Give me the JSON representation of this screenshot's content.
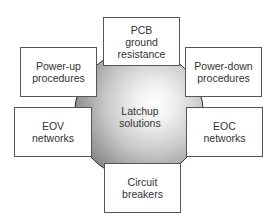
{
  "diagram": {
    "type": "hub-and-spoke",
    "center": {
      "label": "Latchup\nsolutions"
    },
    "nodes": [
      {
        "id": "top",
        "label": "PCB\nground\nresistance"
      },
      {
        "id": "upper-left",
        "label": "Power-up\nprocedures"
      },
      {
        "id": "upper-right",
        "label": "Power-down\nprocedures"
      },
      {
        "id": "lower-left",
        "label": "EOV\nnetworks"
      },
      {
        "id": "lower-right",
        "label": "EOC\nnetworks"
      },
      {
        "id": "bottom",
        "label": "Circuit\nbreakers"
      }
    ]
  }
}
